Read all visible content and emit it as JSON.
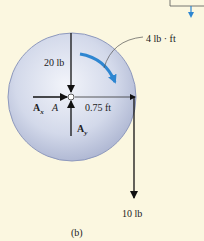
{
  "diagram": {
    "caption": "(b)",
    "moment_label": "4 lb · ft",
    "force_top_label": "20 lb",
    "force_bottom_label": "10 lb",
    "distance_label": "0.75 ft",
    "pin_label": "A",
    "reaction_x": {
      "main": "A",
      "sub": "x"
    },
    "reaction_y": {
      "main": "A",
      "sub": "y"
    },
    "colors": {
      "background": "#fbf7e0",
      "disk": "#c9d0e4",
      "disk_edge": "#8e99bd",
      "moment_arrow": "#2e86d1",
      "force": "#111111"
    }
  }
}
